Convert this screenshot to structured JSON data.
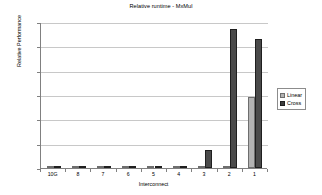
{
  "chart_data": {
    "type": "bar",
    "title": "Relative runtime - MxMul",
    "xlabel": "Interconnect",
    "ylabel": "Relative Performance",
    "categories": [
      "10G",
      "8",
      "7",
      "6",
      "5",
      "4",
      "3",
      "2",
      "1"
    ],
    "series": [
      {
        "name": "Linear",
        "color": "#b3b3b3",
        "values": [
          100.0,
          100.0,
          100.0,
          100.0,
          100.0,
          100.0,
          100.0,
          100.0,
          105.8
        ]
      },
      {
        "name": "Cross",
        "color": "#3d3d3d",
        "values": [
          100.1,
          100.1,
          100.0,
          100.0,
          100.0,
          100.0,
          101.5,
          111.4,
          110.6
        ]
      }
    ],
    "ylim": [
      100,
      112
    ],
    "ytick_values": [
      100,
      102,
      104,
      106,
      108,
      110,
      112
    ],
    "ytick_labels": [
      "100%",
      "102%",
      "104%",
      "106%",
      "108%",
      "110%",
      "112%"
    ],
    "grid": true,
    "legend_position": "right"
  },
  "legend": {
    "entries": [
      {
        "label": "Linear"
      },
      {
        "label": "Cross"
      }
    ]
  }
}
